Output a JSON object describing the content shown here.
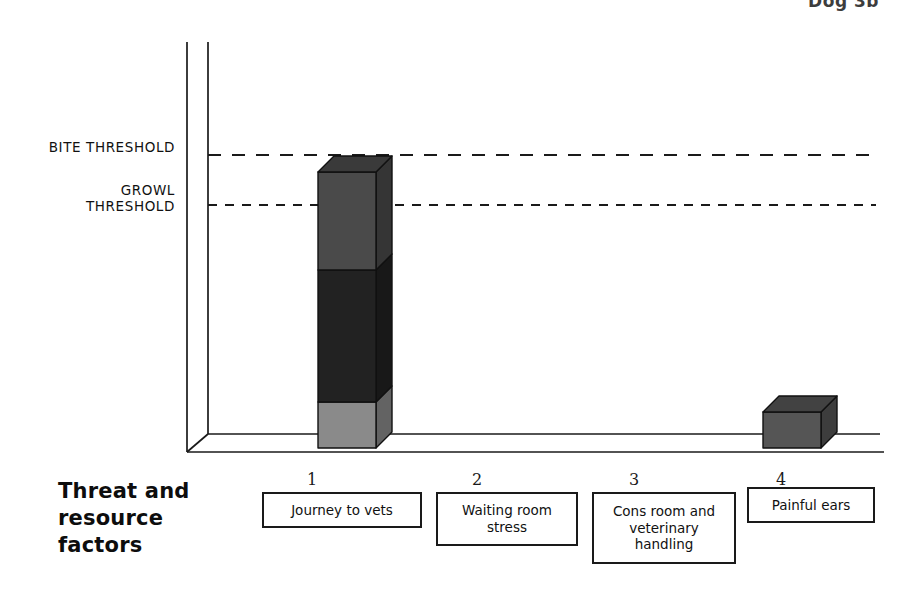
{
  "figure": {
    "corner_caption": "Dog 3b",
    "axis_title": "Threat and\nresource\nfactors"
  },
  "thresholds": {
    "bite": {
      "label": "BITE THRESHOLD",
      "y_px": 155
    },
    "growl": {
      "label": "GROWL\nTHRESHOLD",
      "y_px": 205
    }
  },
  "chart_data": {
    "type": "bar",
    "title": "Dog 3b",
    "subtitle": "",
    "xlabel": "Threat and resource factors",
    "ylabel": "",
    "grid": false,
    "legend_position": "none",
    "stacked": true,
    "three_d": true,
    "ylim": [
      0,
      100
    ],
    "axis_reference_lines": [
      {
        "name": "BITE THRESHOLD",
        "value": 94,
        "style": "dashed"
      },
      {
        "name": "GROWL THRESHOLD",
        "value": 76,
        "style": "dashed"
      }
    ],
    "categories": [
      "1",
      "2",
      "3",
      "4"
    ],
    "category_labels": [
      "Journey to vets",
      "Waiting room\nstress",
      "Cons room and\nveterinary\nhandling",
      "Painful ears"
    ],
    "series": [
      {
        "name": "Journey to vets",
        "color": "#8a8a8a",
        "values": [
          17,
          0,
          0,
          0
        ]
      },
      {
        "name": "Waiting room stress",
        "color": "#222222",
        "values": [
          48,
          0,
          0,
          0
        ]
      },
      {
        "name": "Cons room and veterinary handling",
        "color": "#4a4a4a",
        "values": [
          35,
          0,
          0,
          17
        ]
      }
    ],
    "totals": [
      100,
      0,
      0,
      17
    ]
  },
  "categories": [
    {
      "number": "1",
      "label": "Journey to vets",
      "box": {
        "x": 262,
        "y": 492,
        "w": 160,
        "h": 36
      },
      "num_x": 312,
      "bar": {
        "x": 318,
        "y_top": 172,
        "w": 58,
        "depth": 16,
        "segments": [
          {
            "name": "top-segment",
            "color": "#4a4a4a",
            "top": 172,
            "bottom": 270
          },
          {
            "name": "middle-segment",
            "color": "#222222",
            "top": 270,
            "bottom": 402
          },
          {
            "name": "bottom-segment",
            "color": "#8a8a8a",
            "top": 402,
            "bottom": 448
          }
        ]
      }
    },
    {
      "number": "2",
      "label": "Waiting room\nstress",
      "box": {
        "x": 436,
        "y": 492,
        "w": 142,
        "h": 54
      },
      "num_x": 477,
      "bar": null
    },
    {
      "number": "3",
      "label": "Cons room and\nveterinary\nhandling",
      "box": {
        "x": 592,
        "y": 492,
        "w": 144,
        "h": 72
      },
      "num_x": 634,
      "bar": null
    },
    {
      "number": "4",
      "label": "Painful ears",
      "box": {
        "x": 747,
        "y": 487,
        "w": 128,
        "h": 36
      },
      "num_x": 781,
      "bar": {
        "x": 763,
        "y_top": 412,
        "w": 58,
        "depth": 16,
        "segments": [
          {
            "name": "single-segment",
            "color": "#555555",
            "top": 412,
            "bottom": 448
          }
        ]
      }
    }
  ],
  "colors": {
    "ink": "#1a1a1a",
    "page": "#ffffff",
    "segment_light": "#8a8a8a",
    "segment_dark": "#222222",
    "segment_mid": "#4a4a4a",
    "bar4": "#555555"
  }
}
